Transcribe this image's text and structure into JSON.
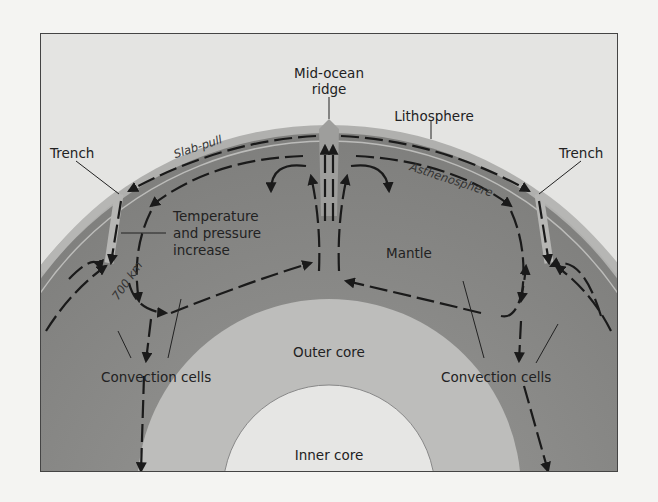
{
  "diagram": {
    "type": "earth-cross-section-plate-tectonics",
    "labels": {
      "mid_ocean_ridge_line1": "Mid-ocean",
      "mid_ocean_ridge_line2": "ridge",
      "lithosphere": "Lithosphere",
      "slab_pull": "Slab-pull",
      "trench_left": "Trench",
      "trench_right": "Trench",
      "asthenosphere": "Asthenosphere",
      "temp_line1": "Temperature",
      "temp_line2": "and pressure",
      "temp_line3": "increase",
      "depth": "700 km",
      "mantle": "Mantle",
      "outer_core": "Outer core",
      "inner_core": "Inner core",
      "convection_left": "Convection cells",
      "convection_right": "Convection cells"
    },
    "colors": {
      "background": "#e4e4e2",
      "lithosphere": "#a9a9a7",
      "mantle": "#8d8d8b",
      "outer_core": "#bdbdbb",
      "inner_core": "#e6e6e4",
      "arrows": "#1a1a1a",
      "frame": "#444444"
    }
  }
}
